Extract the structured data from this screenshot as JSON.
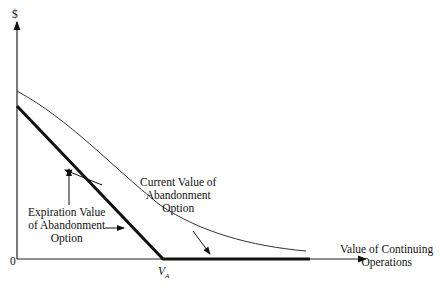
{
  "diagram": {
    "y_axis_label": "$",
    "origin_label": "0",
    "x_axis_label_line1": "Value of Continuing",
    "x_axis_label_line2": "Operations",
    "vA_label": "V",
    "vA_subscript": "A",
    "current_label": [
      "Current Value of",
      "Abandonment",
      "Option"
    ],
    "expiration_label": [
      "Expiration Value",
      "of Abandonment",
      "Option"
    ]
  }
}
